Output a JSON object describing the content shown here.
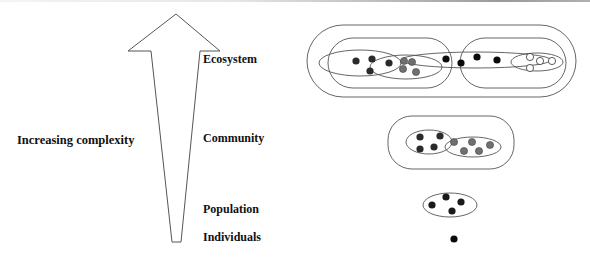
{
  "axis": {
    "label": "Increasing complexity"
  },
  "levels": [
    {
      "id": "ecosystem",
      "label": "Ecosystem"
    },
    {
      "id": "community",
      "label": "Community"
    },
    {
      "id": "population",
      "label": "Population"
    },
    {
      "id": "individuals",
      "label": "Individuals"
    }
  ],
  "colors": {
    "outline": "#444444",
    "dark_dot": "#2b2b2b",
    "grey_dot": "#707070",
    "black_dot": "#0a0a0a",
    "white_dot": "#ffffff"
  }
}
